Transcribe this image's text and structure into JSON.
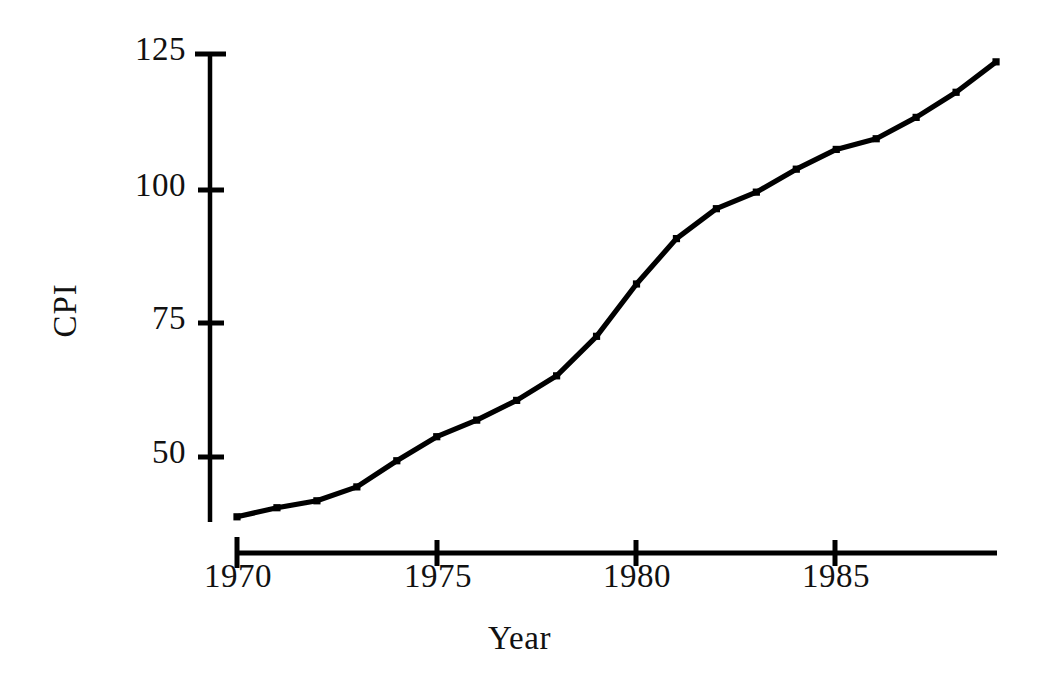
{
  "chart_data": {
    "type": "line",
    "title": "",
    "xlabel": "Year",
    "ylabel": "CPI",
    "x": [
      1970,
      1971,
      1972,
      1973,
      1974,
      1975,
      1976,
      1977,
      1978,
      1979,
      1980,
      1981,
      1982,
      1983,
      1984,
      1985,
      1986,
      1987,
      1988,
      1989
    ],
    "values": [
      38.8,
      40.5,
      41.8,
      44.4,
      49.3,
      53.8,
      56.9,
      60.6,
      65.2,
      72.6,
      82.4,
      90.9,
      96.5,
      99.6,
      103.9,
      107.6,
      109.6,
      113.6,
      118.3,
      124.0
    ],
    "series": [
      {
        "name": "CPI",
        "values": [
          38.8,
          40.5,
          41.8,
          44.4,
          49.3,
          53.8,
          56.9,
          60.6,
          65.2,
          72.6,
          82.4,
          90.9,
          96.5,
          99.6,
          103.9,
          107.6,
          109.6,
          113.6,
          118.3,
          124.0
        ]
      }
    ],
    "xlim": [
      1970,
      1989
    ],
    "ylim": [
      36,
      125
    ],
    "xticks": [
      1970,
      1975,
      1980,
      1985
    ],
    "xtick_labels": [
      "1970",
      "1975",
      "1980",
      "1985"
    ],
    "yticks": [
      50,
      75,
      100,
      125
    ],
    "ytick_labels": [
      "50",
      "75",
      "100",
      "125"
    ],
    "grid": false,
    "legend": null,
    "marker": "square",
    "line_color": "#000000",
    "background_color": "#ffffff",
    "axis_color": "#000000"
  },
  "axes": {
    "y_title": "CPI",
    "x_title": "Year",
    "y_tick_labels": {
      "t125": "125",
      "t100": "100",
      "t75": "75",
      "t50": "50"
    },
    "x_tick_labels": {
      "t1970": "1970",
      "t1975": "1975",
      "t1980": "1980",
      "t1985": "1985"
    }
  }
}
